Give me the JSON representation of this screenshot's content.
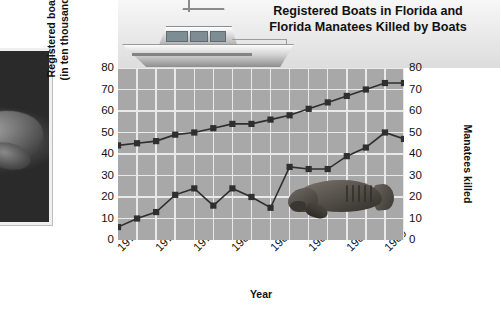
{
  "figure": {
    "title_line1": "Registered Boats in Florida and",
    "title_line2": "Florida Manatees Killed by Boats",
    "left_photo_alt": "manatee-photograph",
    "banner_image_alt": "sport-fishing-boat-illustration",
    "plot_overlay_alt": "manatee-illustration"
  },
  "chart_data": {
    "type": "line",
    "title": "Registered Boats in Florida and Florida Manatees Killed by Boats",
    "xlabel": "Year",
    "ylabel": "Registered boats (in ten thousands)",
    "y2label": "Manatees killed",
    "ylim": [
      0,
      80
    ],
    "y2lim": [
      0,
      80
    ],
    "yticks": [
      0,
      10,
      20,
      30,
      40,
      50,
      60,
      70,
      80
    ],
    "y2ticks": [
      0,
      10,
      20,
      30,
      40,
      50,
      60,
      70,
      80
    ],
    "grid": true,
    "legend": "none",
    "x": [
      1975,
      1976,
      1977,
      1978,
      1979,
      1980,
      1981,
      1982,
      1983,
      1984,
      1985,
      1986,
      1987,
      1988,
      1989,
      1990
    ],
    "xtick_labels": [
      "1975",
      "1977",
      "1979",
      "1981",
      "1983",
      "1985",
      "1987",
      "1989"
    ],
    "xtick_values": [
      1975,
      1977,
      1979,
      1981,
      1983,
      1985,
      1987,
      1989
    ],
    "series": [
      {
        "name": "Registered boats (in ten thousands)",
        "axis": "left",
        "marker": "square",
        "color": "#2f2f2f",
        "values": [
          44,
          45,
          46,
          49,
          50,
          52,
          54,
          54,
          56,
          58,
          61,
          64,
          67,
          70,
          73,
          73
        ]
      },
      {
        "name": "Manatees killed",
        "axis": "right",
        "marker": "square",
        "color": "#2f2f2f",
        "values": [
          6,
          10,
          13,
          21,
          24,
          16,
          24,
          20,
          15,
          34,
          33,
          33,
          39,
          43,
          50,
          47
        ]
      }
    ]
  },
  "axes": {
    "left_title_line1": "Registered boats",
    "left_title_line2": "(in ten thousands)",
    "right_title": "Manatees killed",
    "x_title": "Year"
  }
}
